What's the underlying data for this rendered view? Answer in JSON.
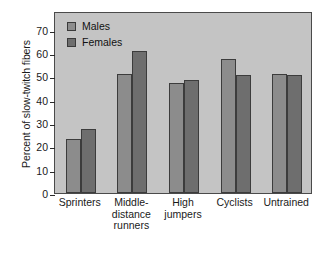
{
  "chart_data": {
    "type": "bar",
    "title": "",
    "subtitle": "",
    "xlabel": "",
    "ylabel": "Percent of slow-twitch fibers",
    "categories": [
      "Sprinters",
      "Middle-distance runners",
      "High jumpers",
      "Cyclists",
      "Untrained"
    ],
    "category_label_lines": [
      [
        "Sprinters"
      ],
      [
        "Middle-",
        "distance",
        "runners"
      ],
      [
        "High",
        "jumpers"
      ],
      [
        "Cyclists"
      ],
      [
        "Untrained"
      ]
    ],
    "series": [
      {
        "name": "Males",
        "values": [
          23,
          51,
          47,
          57.5,
          51
        ],
        "color": "#8c8c8c"
      },
      {
        "name": "Females",
        "values": [
          27.5,
          61,
          48.5,
          50.5,
          50.5
        ],
        "color": "#6e6e6e"
      }
    ],
    "ylim": [
      0,
      78
    ],
    "yticks": [
      0,
      10,
      20,
      30,
      40,
      50,
      60,
      70
    ],
    "ytick_labels": [
      "0",
      "10",
      "20",
      "30",
      "40",
      "50",
      "60",
      "70"
    ],
    "grid": false,
    "legend_position": "top-left",
    "plot_background": "#c4c4c4",
    "axis_color": "#4a4a4a",
    "figure_background": "#ffffff"
  },
  "legend": {
    "items": [
      {
        "label": "Males",
        "color": "#8c8c8c"
      },
      {
        "label": "Females",
        "color": "#6e6e6e"
      }
    ]
  }
}
